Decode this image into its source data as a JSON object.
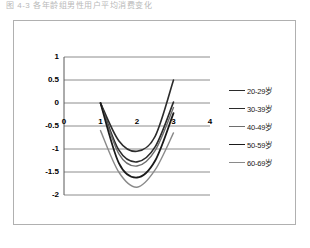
{
  "top_caption": "图 4-3  各年龄组男性用户平均消费变化",
  "chart_data": {
    "type": "line",
    "title": "",
    "subtitle": "",
    "xlabel": "",
    "ylabel": "",
    "x": [
      1,
      1.5,
      2,
      2.5,
      3
    ],
    "xlim": [
      0,
      4
    ],
    "ylim": [
      -2,
      1
    ],
    "xticks": [
      "0",
      "1",
      "2",
      "3",
      "4"
    ],
    "yticks": [
      "1",
      "0.5",
      "0",
      "-0.5",
      "-1",
      "-1.5",
      "-2"
    ],
    "ytick_values": [
      1,
      0.5,
      0,
      -0.5,
      -1,
      -1.5,
      -2
    ],
    "xtick_values": [
      0,
      1,
      2,
      3,
      4
    ],
    "grid": "horizontal",
    "legend_position": "right",
    "origin_label": "0",
    "series": [
      {
        "name": "20-29岁",
        "values": [
          0,
          -0.82,
          -1.05,
          -0.72,
          0.5
        ],
        "color": "#2b2b2b",
        "width": 1.6
      },
      {
        "name": "30-39岁",
        "values": [
          0,
          -1.02,
          -1.28,
          -0.95,
          0.02
        ],
        "color": "#2b2b2b",
        "width": 1.6
      },
      {
        "name": "40-49岁",
        "values": [
          0,
          -1.1,
          -1.37,
          -1.03,
          -0.1
        ],
        "color": "#6e6e6e",
        "width": 1.4
      },
      {
        "name": "50-59岁",
        "values": [
          0,
          -1.3,
          -1.62,
          -1.25,
          -0.22
        ],
        "color": "#1a1a1a",
        "width": 1.8
      },
      {
        "name": "60-69岁",
        "values": [
          -0.6,
          -1.5,
          -1.83,
          -1.45,
          -0.65
        ],
        "color": "#8a8a8a",
        "width": 1.4
      }
    ]
  },
  "legend": {
    "items": [
      {
        "label": "20-29岁"
      },
      {
        "label": "30-39岁"
      },
      {
        "label": "40-49岁"
      },
      {
        "label": "50-59岁"
      },
      {
        "label": "60-69岁"
      }
    ]
  },
  "colors": {
    "frame": "#b0b0b0",
    "grid": "#808080",
    "axis": "#595959",
    "text": "#000000"
  }
}
